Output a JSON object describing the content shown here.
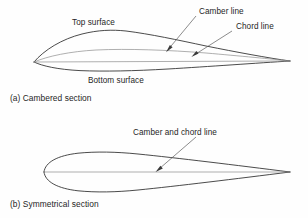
{
  "figure": {
    "background_color": "#fefefe",
    "outline_color": "#2b2b2b",
    "line_color": "#8d8d8d",
    "leader_color": "#5a5a5a",
    "text_color": "#262626"
  },
  "panel_a": {
    "caption": "(a) Cambered section",
    "labels": {
      "top_surface": "Top surface",
      "bottom_surface": "Bottom surface",
      "camber_line": "Camber line",
      "chord_line": "Chord line"
    }
  },
  "panel_b": {
    "caption": "(b) Symmetrical section",
    "labels": {
      "camber_and_chord_line": "Camber and chord line"
    }
  }
}
